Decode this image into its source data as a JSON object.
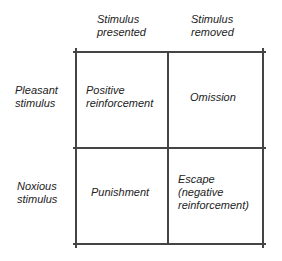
{
  "columns": [
    {
      "label_line1": "Stimulus",
      "label_line2": "presented"
    },
    {
      "label_line1": "Stimulus",
      "label_line2": "removed"
    }
  ],
  "rows": [
    {
      "label_line1": "Pleasant",
      "label_line2": "stimulus"
    },
    {
      "label_line1": "Noxious",
      "label_line2": "stimulus"
    }
  ],
  "cells": {
    "pleasant_presented": {
      "line1": "Positive",
      "line2": "reinforcement"
    },
    "pleasant_removed": {
      "line1": "Omission"
    },
    "noxious_presented": {
      "line1": "Punishment"
    },
    "noxious_removed": {
      "line1": "Escape",
      "line2": "(negative",
      "line3": "reinforcement)"
    }
  },
  "colors": {
    "line": "#444444",
    "text": "#222222",
    "background": "#ffffff"
  }
}
